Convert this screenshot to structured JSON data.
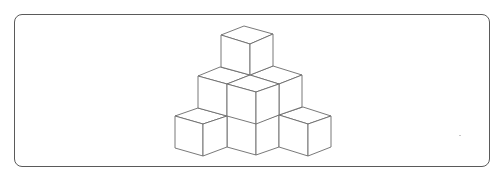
{
  "figure": {
    "type": "isometric-cube-stack",
    "description": "Pyramid of stacked unit cubes drawn in isometric line art",
    "layers": [
      {
        "level": "top",
        "cube_count": 1
      },
      {
        "level": "middle",
        "cube_count": 3
      },
      {
        "level": "bottom",
        "cube_count": 3
      }
    ],
    "visible_cube_count": 7,
    "colors": {
      "border": "#5a5a5a",
      "line": "#6a6a6a",
      "fill": "#ffffff",
      "background": "#ffffff"
    }
  }
}
